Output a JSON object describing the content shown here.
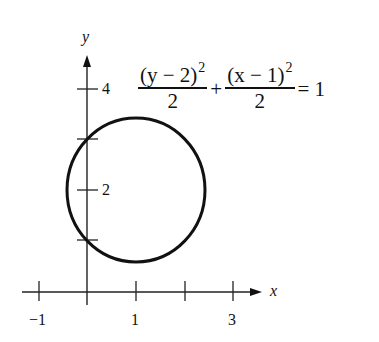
{
  "figure": {
    "equation": {
      "term1": {
        "numerator": "(y − 2)",
        "exponent": "2",
        "denominator": "2",
        "var": "y",
        "shift": "2"
      },
      "plus": "+",
      "term2": {
        "numerator": "(x − 1)",
        "exponent": "2",
        "denominator": "2",
        "var": "x",
        "shift": "1"
      },
      "equals": "= 1"
    },
    "axes": {
      "x_label": "x",
      "y_label": "y",
      "x_ticks": [
        {
          "value": -1,
          "label": "−1"
        },
        {
          "value": 1,
          "label": "1"
        },
        {
          "value": 2,
          "label": ""
        },
        {
          "value": 3,
          "label": "3"
        }
      ],
      "y_ticks": [
        {
          "value": 1,
          "label": ""
        },
        {
          "value": 2,
          "label": "2"
        },
        {
          "value": 3,
          "label": ""
        },
        {
          "value": 4,
          "label": "4"
        }
      ]
    },
    "curve": {
      "type": "ellipse",
      "center": [
        1,
        2
      ],
      "semi_axis_x": 1.414,
      "semi_axis_y": 1.414,
      "color": "#111111"
    }
  }
}
